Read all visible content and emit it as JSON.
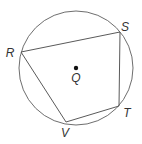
{
  "diagram": {
    "type": "inscribed-quadrilateral-in-circle",
    "circle": {
      "center_label": "Q",
      "cx": 76,
      "cy": 68,
      "r": 57
    },
    "vertices": [
      {
        "label": "R",
        "x": 21,
        "y": 52,
        "label_x": 10,
        "label_y": 53
      },
      {
        "label": "S",
        "x": 120,
        "y": 32,
        "label_x": 125,
        "label_y": 27
      },
      {
        "label": "T",
        "x": 119,
        "y": 106,
        "label_x": 127,
        "label_y": 113
      },
      {
        "label": "V",
        "x": 66,
        "y": 122,
        "label_x": 65,
        "label_y": 133
      }
    ],
    "center": {
      "label": "Q",
      "x": 76,
      "y": 68,
      "label_x": 76,
      "label_y": 78
    },
    "edges": [
      "RS",
      "ST",
      "TV",
      "VR"
    ],
    "colors": {
      "stroke": "#5a5a5a",
      "circle": "#6e6e6e",
      "dot": "#111111",
      "label": "#333333",
      "background": "#ffffff"
    }
  }
}
